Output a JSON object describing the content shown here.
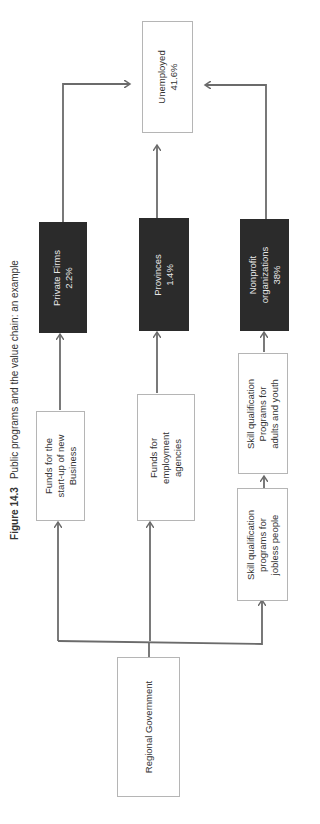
{
  "figure": {
    "number": "Figure 14.3",
    "title": "Public programs and the value chain: an example"
  },
  "nodes": {
    "unemployed": {
      "lines": [
        "Unemployed",
        "41.6%"
      ]
    },
    "private_firms": {
      "lines": [
        "Private Firms",
        "2.2%"
      ]
    },
    "provinces": {
      "lines": [
        "Provinces",
        "1.4%"
      ]
    },
    "nonprofit": {
      "lines": [
        "Nonprofit",
        "organizations",
        "38%"
      ]
    },
    "funds_startup": {
      "lines": [
        "Funds for the",
        "start-up of new",
        "Business"
      ]
    },
    "funds_employment": {
      "lines": [
        "Funds for",
        "employment",
        "agencies"
      ]
    },
    "skill_adults_youth": {
      "lines": [
        "Skill qualification",
        "Programs for",
        "adults and youth"
      ]
    },
    "skill_jobless": {
      "lines": [
        "Skill qualification",
        "programs  for",
        "jobless people"
      ]
    },
    "regional_government": {
      "lines": [
        "Regional Government"
      ]
    }
  },
  "edges": [
    {
      "from": "regional_government",
      "to": "funds_startup"
    },
    {
      "from": "regional_government",
      "to": "funds_employment"
    },
    {
      "from": "regional_government",
      "to": "skill_jobless"
    },
    {
      "from": "funds_startup",
      "to": "private_firms"
    },
    {
      "from": "funds_employment",
      "to": "provinces"
    },
    {
      "from": "skill_jobless",
      "to": "skill_adults_youth"
    },
    {
      "from": "skill_adults_youth",
      "to": "nonprofit"
    },
    {
      "from": "private_firms",
      "to": "unemployed"
    },
    {
      "from": "provinces",
      "to": "unemployed"
    },
    {
      "from": "nonprofit",
      "to": "unemployed"
    }
  ],
  "colors": {
    "dark_box": "#2b2b2b",
    "border": "#b5b5b5",
    "arrow": "#6b6b6b"
  }
}
